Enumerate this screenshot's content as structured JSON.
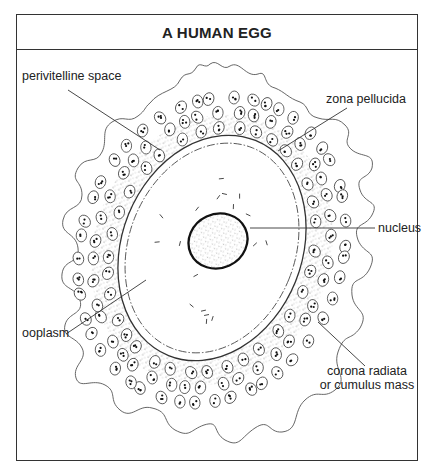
{
  "title": "A HUMAN EGG",
  "labels": [
    {
      "id": "perivitelline-space",
      "text": [
        "perivitelline space"
      ],
      "x": 22,
      "y": 80,
      "anchor": "start",
      "line": [
        68,
        90,
        160,
        150
      ]
    },
    {
      "id": "zona-pellucida",
      "text": [
        "zona pellucida"
      ],
      "x": 326,
      "y": 103,
      "anchor": "start",
      "line": [
        347,
        108,
        278,
        151
      ]
    },
    {
      "id": "nucleus",
      "text": [
        "nucleus"
      ],
      "x": 378,
      "y": 232,
      "anchor": "start",
      "line": [
        250,
        228,
        375,
        228
      ]
    },
    {
      "id": "ooplasm",
      "text": [
        "ooplasm"
      ],
      "x": 22,
      "y": 337,
      "anchor": "start",
      "line": [
        66,
        334,
        146,
        280
      ]
    },
    {
      "id": "corona-radiata",
      "text": [
        "corona radiata",
        "or cumulus mass"
      ],
      "x": 367,
      "y": 375,
      "anchor": "middle",
      "line": [
        318,
        322,
        365,
        366
      ]
    }
  ],
  "colors": {
    "line": "#333333",
    "cell": "#444444",
    "frame": "#333333"
  }
}
